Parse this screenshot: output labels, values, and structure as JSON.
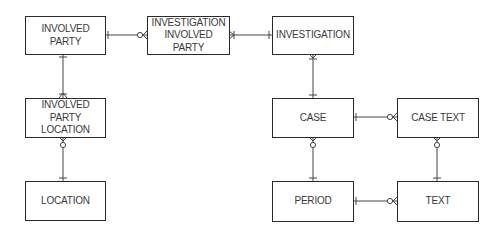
{
  "diagram": {
    "type": "entity-relationship",
    "notation": "crow's foot",
    "entities": [
      {
        "id": "involved_party",
        "label": "INVOLVED\nPARTY"
      },
      {
        "id": "investigation_involved_party",
        "label": "INVESTIGATION\nINVOLVED PARTY"
      },
      {
        "id": "investigation",
        "label": "INVESTIGATION"
      },
      {
        "id": "involved_party_location",
        "label": "INVOLVED\nPARTY\nLOCATION"
      },
      {
        "id": "location",
        "label": "LOCATION"
      },
      {
        "id": "case",
        "label": "CASE"
      },
      {
        "id": "case_text",
        "label": "CASE TEXT"
      },
      {
        "id": "period",
        "label": "PERIOD"
      },
      {
        "id": "text",
        "label": "TEXT"
      }
    ],
    "relationships": [
      {
        "from": "INVOLVED PARTY",
        "from_card": "one",
        "to": "INVESTIGATION INVOLVED PARTY",
        "to_card": "zero-or-many"
      },
      {
        "from": "INVESTIGATION",
        "from_card": "one",
        "to": "INVESTIGATION INVOLVED PARTY",
        "to_card": "one-or-many"
      },
      {
        "from": "INVOLVED PARTY",
        "from_card": "one",
        "to": "INVOLVED PARTY LOCATION",
        "to_card": "one-or-many"
      },
      {
        "from": "LOCATION",
        "from_card": "one",
        "to": "INVOLVED PARTY LOCATION",
        "to_card": "zero-or-many"
      },
      {
        "from": "CASE",
        "from_card": "one",
        "to": "INVESTIGATION",
        "to_card": "one-or-many"
      },
      {
        "from": "CASE",
        "from_card": "one",
        "to": "CASE TEXT",
        "to_card": "zero-or-many"
      },
      {
        "from": "PERIOD",
        "from_card": "one",
        "to": "CASE",
        "to_card": "zero-or-many"
      },
      {
        "from": "TEXT",
        "from_card": "one",
        "to": "CASE TEXT",
        "to_card": "zero-or-many"
      },
      {
        "from": "PERIOD",
        "from_card": "one",
        "to": "TEXT",
        "to_card": "zero-or-many"
      }
    ],
    "colors": {
      "line": "#444444",
      "border": "#2a2a2a",
      "text": "#3a3a3a",
      "background": "#ffffff"
    }
  }
}
